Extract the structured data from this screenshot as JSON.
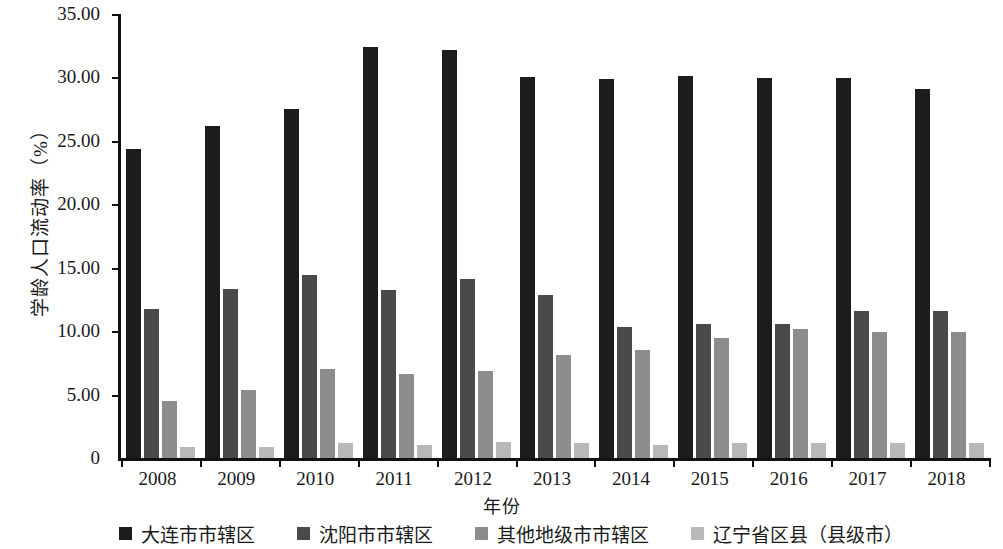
{
  "chart_data": {
    "type": "bar",
    "title": "",
    "xlabel": "年份",
    "ylabel": "学龄人口流动率（%）",
    "categories": [
      "2008",
      "2009",
      "2010",
      "2011",
      "2012",
      "2013",
      "2014",
      "2015",
      "2016",
      "2017",
      "2018"
    ],
    "ylim": [
      0,
      35
    ],
    "yticks": [
      "0",
      "5.00",
      "10.00",
      "15.00",
      "20.00",
      "25.00",
      "30.00",
      "35.00"
    ],
    "ytick_values": [
      0,
      5,
      10,
      15,
      20,
      25,
      30,
      35
    ],
    "grid": false,
    "legend_position": "bottom",
    "series": [
      {
        "name": "大连市市辖区",
        "color": "#1c1c1c",
        "values": [
          24.35,
          26.15,
          27.55,
          32.4,
          32.15,
          30.0,
          29.9,
          30.1,
          29.95,
          29.95,
          29.1
        ]
      },
      {
        "name": "沈阳市市辖区",
        "color": "#4a4a4a",
        "values": [
          11.75,
          13.35,
          14.45,
          13.25,
          14.1,
          12.85,
          10.35,
          10.6,
          10.55,
          11.55,
          11.55
        ]
      },
      {
        "name": "其他地级市市辖区",
        "color": "#8d8d8d",
        "values": [
          4.5,
          5.35,
          7.0,
          6.6,
          6.85,
          8.1,
          8.55,
          9.45,
          10.15,
          9.95,
          9.9
        ]
      },
      {
        "name": "辽宁省区县（县级市）",
        "color": "#b8b8b8",
        "values": [
          0.9,
          0.9,
          1.15,
          1.0,
          1.3,
          1.2,
          1.0,
          1.15,
          1.15,
          1.15,
          1.2
        ]
      }
    ]
  }
}
